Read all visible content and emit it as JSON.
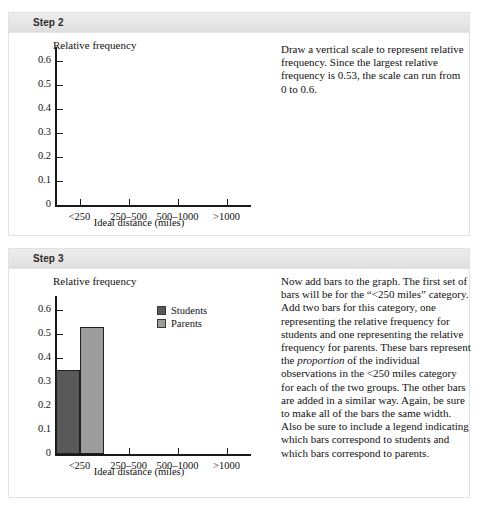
{
  "steps": [
    {
      "header": "Step 2",
      "text_html": "Draw a vertical scale to represent relative frequency. Since the largest relative frequency is 0.53, the scale can run from 0 to 0.6."
    },
    {
      "header": "Step 3",
      "text_html": "Now add bars to the graph. The first set of bars will be for the “&lt;250 miles” category. Add two bars for this category, one representing the relative frequency for students and one representing the relative frequency for parents. These bars represent the <i>proportion</i> of the individual observations in the &lt;250 miles category for each of the two groups. The other bars are added in a similar way. Again, be sure to make all of the bars the same width. Also be sure to include a legend indicating which bars correspond to students and which bars correspond to parents."
    }
  ],
  "chart_data": [
    {
      "id": "step2",
      "type": "bar",
      "title": "Relative frequency",
      "xlabel": "Ideal distance (miles)",
      "ylabel": "",
      "categories": [
        "<250",
        "250–500",
        "500–1000",
        ">1000"
      ],
      "yticks": [
        "0.6",
        "0.5",
        "0.4",
        "0.3",
        "0.2",
        "0.1",
        "0"
      ],
      "ytick_values": [
        0.6,
        0.5,
        0.4,
        0.3,
        0.2,
        0.1,
        0
      ],
      "ylim": [
        0,
        0.6
      ],
      "grid": false,
      "legend": null,
      "series": []
    },
    {
      "id": "step3",
      "type": "bar",
      "title": "Relative frequency",
      "xlabel": "Ideal distance (miles)",
      "ylabel": "",
      "categories": [
        "<250",
        "250–500",
        "500–1000",
        ">1000"
      ],
      "yticks": [
        "0.6",
        "0.5",
        "0.4",
        "0.3",
        "0.2",
        "0.1",
        "0"
      ],
      "ytick_values": [
        0.6,
        0.5,
        0.4,
        0.3,
        0.2,
        0.1,
        0
      ],
      "ylim": [
        0,
        0.6
      ],
      "grid": false,
      "legend_position": "upper right",
      "series": [
        {
          "name": "Students",
          "color": "#595959",
          "values": [
            0.35,
            null,
            null,
            null
          ]
        },
        {
          "name": "Parents",
          "color": "#9c9c9c",
          "values": [
            0.53,
            null,
            null,
            null
          ]
        }
      ]
    }
  ],
  "colors": {
    "students": "#595959",
    "parents": "#9c9c9c",
    "axis": "#1a1a1a",
    "header_band": "#e6e6e6",
    "panel_border": "#e2e2e2"
  }
}
